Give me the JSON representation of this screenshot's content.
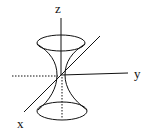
{
  "diagram": {
    "axes": {
      "x": {
        "label": "x"
      },
      "y": {
        "label": "y"
      },
      "z": {
        "label": "z"
      }
    },
    "colors": {
      "stroke": "#111111",
      "background": "#ffffff"
    }
  }
}
